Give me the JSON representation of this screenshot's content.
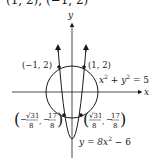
{
  "header": {
    "text": "(1, 2), (−1, 2)"
  },
  "axes": {
    "x_label": "x",
    "y_label": "y"
  },
  "curves": {
    "circle": {
      "equation": "x² + y² = 5",
      "eq_lhs": "x",
      "eq_mid": " + y",
      "eq_rhs": " = 5",
      "sup": "2"
    },
    "parabola": {
      "equation": "y = 8x² − 6",
      "eq_a": "y = 8x",
      "eq_b": " − 6",
      "sup": "2"
    }
  },
  "points": {
    "top_left": "(−1, 2)",
    "top_right": "(1, 2)",
    "bottom_left": {
      "num_x": "√31",
      "den_x": "8",
      "num_y": "17",
      "den_y": "8",
      "sign_x": "−",
      "sign_y": "−"
    },
    "bottom_right": {
      "num_x": "√31",
      "den_x": "8",
      "num_y": "17",
      "den_y": "8",
      "sign_x": "",
      "sign_y": "−"
    }
  },
  "colors": {
    "ink": "#1a1a1a",
    "background": "#ffffff"
  }
}
